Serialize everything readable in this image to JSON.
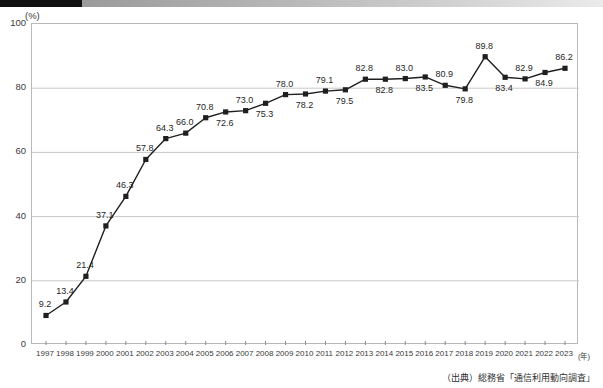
{
  "header": {
    "bar_dark_color": "#111111",
    "bar_gradient_from": "#9a9a9a",
    "bar_gradient_to": "#ebebeb"
  },
  "axis": {
    "unit_label": "(%)",
    "x_unit_label": "(年)",
    "y_ticks": [
      "0",
      "20",
      "40",
      "60",
      "80",
      "100"
    ]
  },
  "source_note": "（出典）総務省「通信利用動向調査」",
  "chart_data": {
    "type": "line",
    "title": "",
    "subtitle": "",
    "xlabel": "(年)",
    "ylabel": "(%)",
    "ylim": [
      0,
      100
    ],
    "grid": true,
    "legend": false,
    "marker": "square",
    "line_color": "#1f1f1f",
    "marker_color": "#1f1f1f",
    "grid_color": "#c8c8c8",
    "categories": [
      "1997",
      "1998",
      "1999",
      "2000",
      "2001",
      "2002",
      "2003",
      "2004",
      "2005",
      "2006",
      "2007",
      "2008",
      "2009",
      "2010",
      "2011",
      "2012",
      "2013",
      "2014",
      "2015",
      "2016",
      "2017",
      "2018",
      "2019",
      "2020",
      "2021",
      "2022",
      "2023"
    ],
    "values": [
      9.2,
      13.4,
      21.4,
      37.1,
      46.3,
      57.8,
      64.3,
      66.0,
      70.8,
      72.6,
      73.0,
      75.3,
      78.0,
      78.2,
      79.1,
      79.5,
      82.8,
      82.8,
      83.0,
      83.5,
      80.9,
      79.8,
      89.8,
      83.4,
      82.9,
      84.9,
      86.2
    ],
    "label_positions": [
      "above",
      "above",
      "above",
      "above",
      "above",
      "above",
      "above",
      "above",
      "above",
      "below",
      "above",
      "below",
      "above",
      "below",
      "above",
      "below",
      "above",
      "below",
      "above",
      "below",
      "above",
      "below",
      "above",
      "below",
      "above",
      "below",
      "above"
    ],
    "value_labels": [
      "9.2",
      "13.4",
      "21.4",
      "37.1",
      "46.3",
      "57.8",
      "64.3",
      "66.0",
      "70.8",
      "72.6",
      "73.0",
      "75.3",
      "78.0",
      "78.2",
      "79.1",
      "79.5",
      "82.8",
      "82.8",
      "83.0",
      "83.5",
      "80.9",
      "79.8",
      "89.8",
      "83.4",
      "82.9",
      "84.9",
      "86.2"
    ]
  }
}
